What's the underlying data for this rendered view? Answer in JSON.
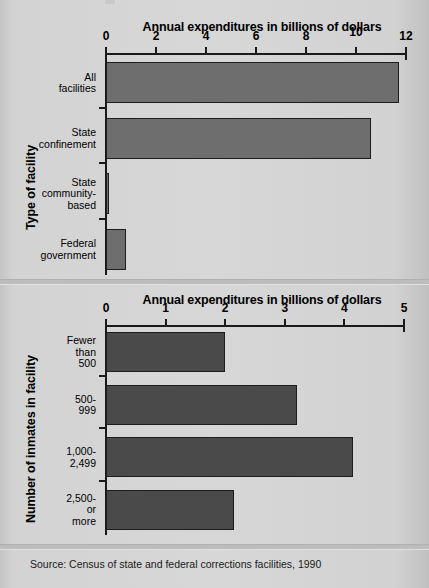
{
  "source_note": "Source: Census of state and federal corrections facilities, 1990",
  "chart_data": [
    {
      "type": "bar",
      "orientation": "horizontal",
      "title": "Annual expenditures in billions of dollars",
      "xlabel": "Annual expenditures in billions of dollars",
      "ylabel": "Type of facility",
      "categories": [
        "All\nfacilities",
        "State\nconfinement",
        "State\ncommunity-\nbased",
        "Federal\ngovernment"
      ],
      "values": [
        11.7,
        10.6,
        0.1,
        0.8
      ],
      "xlim": [
        0,
        12
      ],
      "xticks": [
        0,
        2,
        4,
        6,
        8,
        10,
        12
      ],
      "xtick_labels": [
        "0",
        "2",
        "4",
        "6",
        "8",
        "10",
        "12"
      ],
      "grid": false,
      "legend": false,
      "bar_color": "#6e6e6e"
    },
    {
      "type": "bar",
      "orientation": "horizontal",
      "title": "Annual expenditures in billions of dollars",
      "xlabel": "Annual expenditures in billions of dollars",
      "ylabel": "Number of inmates in facility",
      "categories": [
        "Fewer\nthan\n500",
        "500-\n999",
        "1,000-\n2,499",
        "2,500-\nor\nmore"
      ],
      "values": [
        2.0,
        3.2,
        4.15,
        2.15
      ],
      "xlim": [
        0,
        5
      ],
      "xticks": [
        0,
        1,
        2,
        3,
        4,
        5
      ],
      "xtick_labels": [
        "0",
        "1",
        "2",
        "3",
        "4",
        "5"
      ],
      "grid": false,
      "legend": false,
      "bar_color": "#4a4a4a"
    }
  ]
}
